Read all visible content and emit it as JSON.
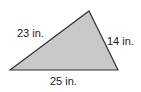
{
  "diagram": {
    "shape": "triangle",
    "fill_color": "#c8c8c8",
    "stroke_color": "#333333",
    "vertices": {
      "left": [
        10,
        70
      ],
      "top": [
        89,
        11
      ],
      "right": [
        118,
        70
      ]
    },
    "sides": [
      {
        "id": "left",
        "label": "23 in.",
        "length": 23,
        "unit": "in."
      },
      {
        "id": "right",
        "label": "14 in.",
        "length": 14,
        "unit": "in."
      },
      {
        "id": "bottom",
        "label": "25 in.",
        "length": 25,
        "unit": "in."
      }
    ]
  }
}
